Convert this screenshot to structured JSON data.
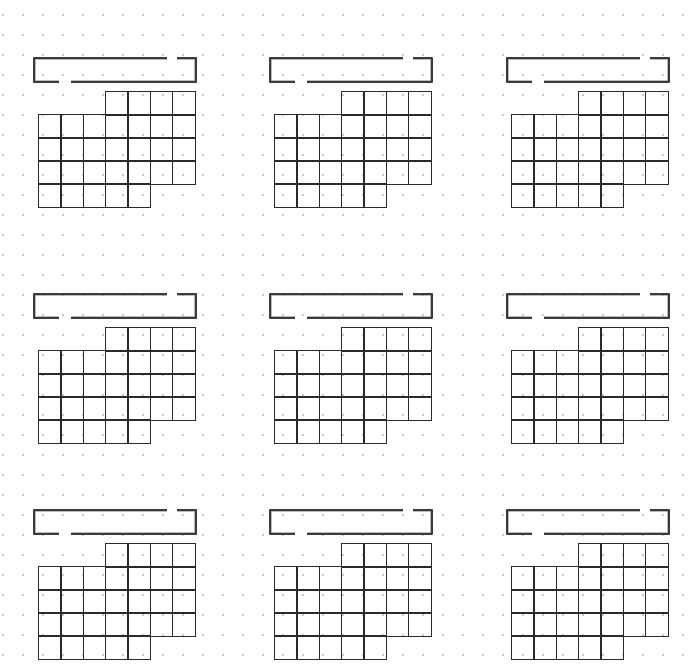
{
  "page": {
    "watermark_text": "",
    "background": "#ffffff",
    "dot_color": "#c9c9c9",
    "line_color": "#2a2a2a"
  },
  "layout": {
    "block_columns_x": [
      33,
      269,
      506
    ],
    "block_rows_y": [
      57,
      293,
      509
    ],
    "cell_width": 22.3,
    "cell_height": 23
  },
  "calendar_template": {
    "columns": 7,
    "rows": 5,
    "row_cells": [
      {
        "row": 0,
        "start_col": 3,
        "end_col": 6
      },
      {
        "row": 1,
        "start_col": 0,
        "end_col": 6
      },
      {
        "row": 2,
        "start_col": 0,
        "end_col": 6
      },
      {
        "row": 3,
        "start_col": 0,
        "end_col": 6
      },
      {
        "row": 4,
        "start_col": 0,
        "end_col": 4
      }
    ]
  },
  "blocks": [
    {
      "id": "month-1",
      "title": ""
    },
    {
      "id": "month-2",
      "title": ""
    },
    {
      "id": "month-3",
      "title": ""
    },
    {
      "id": "month-4",
      "title": ""
    },
    {
      "id": "month-5",
      "title": ""
    },
    {
      "id": "month-6",
      "title": ""
    },
    {
      "id": "month-7",
      "title": ""
    },
    {
      "id": "month-8",
      "title": ""
    },
    {
      "id": "month-9",
      "title": ""
    }
  ]
}
